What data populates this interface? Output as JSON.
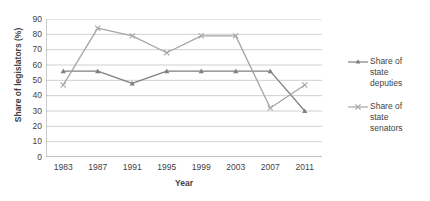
{
  "chart_data": {
    "type": "line",
    "title": "",
    "xlabel": "Year",
    "ylabel": "Share of legislators (%)",
    "categories": [
      "1983",
      "1987",
      "1991",
      "1995",
      "1999",
      "2003",
      "2007",
      "2011"
    ],
    "ylim": [
      0,
      90
    ],
    "ytick_step": 10,
    "yticks": [
      "90",
      "80",
      "70",
      "60",
      "50",
      "40",
      "30",
      "20",
      "10",
      "0"
    ],
    "grid": "horizontal",
    "legend_position": "right",
    "series": [
      {
        "name": "Share of state deputies",
        "values": [
          56,
          56,
          48,
          56,
          56,
          56,
          56,
          30
        ],
        "color": "#808080",
        "marker": "triangle"
      },
      {
        "name": "Share of state senators",
        "values": [
          47,
          84,
          79,
          68,
          79,
          79,
          32,
          47
        ],
        "color": "#a6a6a6",
        "marker": "cross"
      }
    ]
  },
  "legend": {
    "entries": [
      {
        "label_line1": "Share of",
        "label_line2": "state",
        "label_line3": "deputies"
      },
      {
        "label_line1": "Share of",
        "label_line2": "state",
        "label_line3": "senators"
      }
    ]
  },
  "axes": {
    "x_title": "Year",
    "y_title": "Share of legislators (%)"
  },
  "colors": {
    "series_deputies": "#808080",
    "series_senators": "#a6a6a6",
    "gridline": "#d0d0d0",
    "axis": "#9a9a9a",
    "text": "#3f3f3f"
  }
}
